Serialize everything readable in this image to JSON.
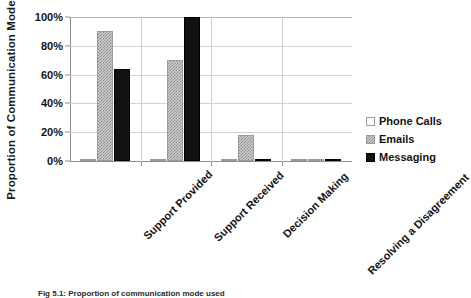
{
  "chart_data": {
    "type": "bar",
    "title": "",
    "xlabel": "",
    "ylabel": "Proportion of Communication Mode",
    "categories": [
      "Support Provided",
      "Support Received",
      "Decision Making",
      "Resolving a Disagreement"
    ],
    "series": [
      {
        "name": "Phone Calls",
        "values": [
          0,
          0,
          0,
          0
        ],
        "color": "#ffffff"
      },
      {
        "name": "Emails",
        "values": [
          90,
          70,
          18,
          0
        ],
        "color": "#cfcfcf"
      },
      {
        "name": "Messaging",
        "values": [
          64,
          100,
          0,
          0
        ],
        "color": "#111111"
      }
    ],
    "ylim": [
      0,
      100
    ],
    "ytick_labels": [
      "0%",
      "20%",
      "40%",
      "60%",
      "80%",
      "100%"
    ],
    "ytick_values": [
      0,
      20,
      40,
      60,
      80,
      100
    ],
    "grid": true,
    "legend_position": "right"
  },
  "legend": {
    "entries": [
      {
        "label": "Phone Calls"
      },
      {
        "label": "Emails"
      },
      {
        "label": "Messaging"
      }
    ]
  },
  "caption": {
    "text": "Fig 5.1: Proportion of communication mode used"
  }
}
